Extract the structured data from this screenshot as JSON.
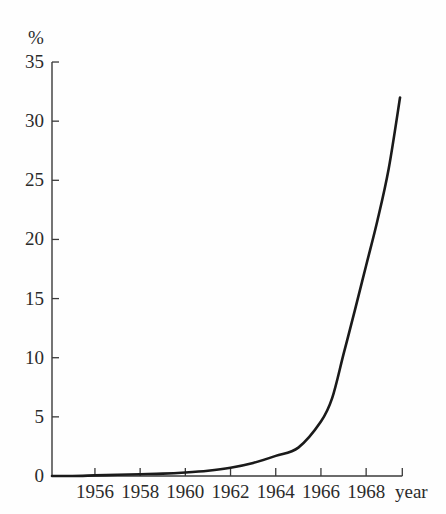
{
  "chart_data": {
    "type": "line",
    "title": "",
    "subtitle": "",
    "xlabel": "year",
    "ylabel": "%",
    "ylim": [
      0,
      35
    ],
    "xlim": [
      1954.1,
      1969.6
    ],
    "grid": false,
    "legend": null,
    "y_ticks": [
      0,
      5,
      10,
      15,
      20,
      25,
      30,
      35
    ],
    "y_tick_labels": [
      "0",
      "5",
      "10",
      "15",
      "20",
      "25",
      "30",
      "35"
    ],
    "x_ticks": [
      1956,
      1958,
      1960,
      1962,
      1964,
      1966,
      1968
    ],
    "x_tick_labels": [
      "1956",
      "1958",
      "1960",
      "1962",
      "1964",
      "1966",
      "1968"
    ],
    "series": [
      {
        "name": "percent",
        "x": [
          1954.1,
          1955,
          1956,
          1957,
          1958,
          1959,
          1960,
          1961,
          1962,
          1963,
          1964,
          1965,
          1966,
          1966.5,
          1967,
          1967.5,
          1968,
          1968.5,
          1969,
          1969.5
        ],
        "values": [
          0.0,
          0.0,
          0.05,
          0.1,
          0.15,
          0.2,
          0.3,
          0.45,
          0.7,
          1.1,
          1.7,
          2.4,
          4.6,
          6.6,
          10.3,
          14.0,
          17.8,
          21.6,
          26.0,
          32.0
        ]
      }
    ],
    "line_color": "#1a1a1a",
    "axis_color": "#3a3a3a"
  },
  "axes": {
    "unit_label": "%",
    "x_axis_label": "year"
  },
  "geometry": {
    "x0_px": 52,
    "y0_px": 476,
    "x_per_year": 22.6,
    "x_origin_year": 1954.1,
    "px_per_unit_y": 11.828
  }
}
